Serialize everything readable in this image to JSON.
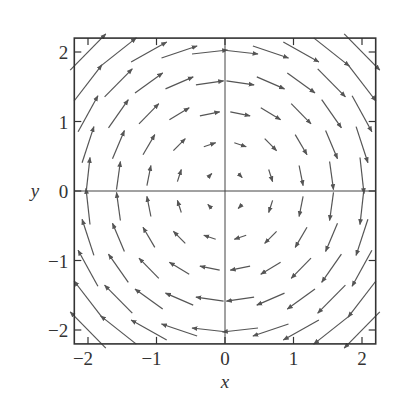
{
  "chart_data": {
    "type": "quiver",
    "title": "",
    "xlabel": "x",
    "ylabel": "y",
    "xlim": [
      -2.2,
      2.2
    ],
    "ylim": [
      -2.2,
      2.2
    ],
    "xticks": [
      -2,
      -1,
      0,
      1,
      2
    ],
    "yticks": [
      -2,
      -1,
      0,
      1,
      2
    ],
    "xtick_labels": [
      "−2",
      "−1",
      "0",
      "1",
      "2"
    ],
    "ytick_labels": [
      "−2",
      "−1",
      "0",
      "1",
      "2"
    ],
    "grid": false,
    "axes_lines": {
      "x_zero": true,
      "y_zero": true
    },
    "field": {
      "u": "y",
      "v": "-x",
      "description": "clockwise rotational field F(x,y) = (y, -x)"
    },
    "grid_points": {
      "x_start": -2,
      "x_end": 2,
      "nx": 10,
      "y_start": -2,
      "y_end": 2,
      "ny": 10
    },
    "arrow_color": "#555555",
    "frame_color": "#333333"
  }
}
